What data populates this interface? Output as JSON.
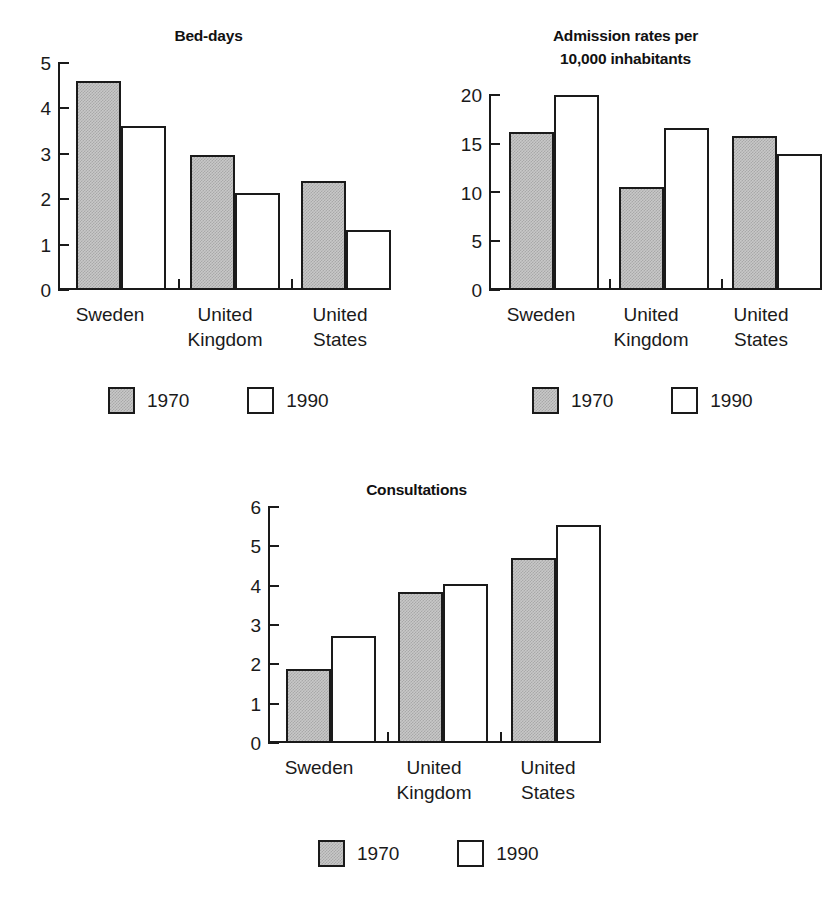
{
  "figure": {
    "background": "#ffffff",
    "ink_color": "#1a1a1a",
    "fill_1970": "#c8c8c8",
    "fill_1990": "#ffffff",
    "scan_remnant": ""
  },
  "legend": {
    "items": [
      {
        "label": "1970",
        "swatch": "gray-hatched-square"
      },
      {
        "label": "1990",
        "swatch": "white-square"
      }
    ]
  },
  "categories": [
    "Sweden",
    "United\nKingdom",
    "United\nStates"
  ],
  "chart_data": [
    {
      "type": "bar",
      "title": "Bed-days",
      "xlabel": "",
      "ylabel": "",
      "categories": [
        "Sweden",
        "United Kingdom",
        "United States"
      ],
      "yticks": [
        0,
        1,
        2,
        3,
        4,
        5
      ],
      "ylim": [
        0,
        5
      ],
      "grid": false,
      "legend_position": "below",
      "series": [
        {
          "name": "1970",
          "values": [
            4.6,
            2.97,
            2.4
          ]
        },
        {
          "name": "1990",
          "values": [
            3.62,
            2.14,
            1.33
          ]
        }
      ]
    },
    {
      "type": "bar",
      "title": "Admission rates per\n10,000 inhabitants",
      "title_line1": "Admission rates per",
      "title_line2": "10,000 inhabitants",
      "xlabel": "",
      "ylabel": "",
      "categories": [
        "Sweden",
        "United Kingdom",
        "United States"
      ],
      "yticks": [
        0,
        5,
        10,
        15,
        20
      ],
      "ylim": [
        0,
        20
      ],
      "grid": false,
      "legend_position": "below",
      "series": [
        {
          "name": "1970",
          "values": [
            16.2,
            10.6,
            15.8
          ]
        },
        {
          "name": "1990",
          "values": [
            20.0,
            16.6,
            14.0
          ]
        }
      ]
    },
    {
      "type": "bar",
      "title": "Consultations",
      "xlabel": "",
      "ylabel": "",
      "categories": [
        "Sweden",
        "United Kingdom",
        "United States"
      ],
      "yticks": [
        0,
        1,
        2,
        3,
        4,
        5,
        6
      ],
      "ylim": [
        0,
        6
      ],
      "grid": false,
      "legend_position": "below",
      "series": [
        {
          "name": "1970",
          "values": [
            1.88,
            3.85,
            4.7
          ]
        },
        {
          "name": "1990",
          "values": [
            2.72,
            4.05,
            5.55
          ]
        }
      ]
    }
  ]
}
